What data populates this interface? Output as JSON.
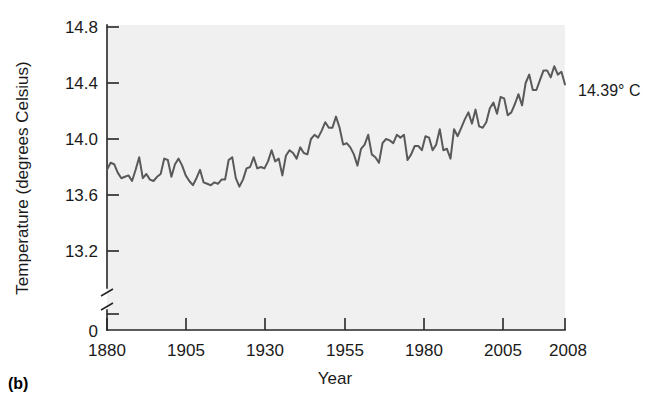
{
  "figure": {
    "panel_label": "(b)",
    "annotation": "14.39° C"
  },
  "chart_data": {
    "type": "line",
    "title": "",
    "xlabel": "Year",
    "ylabel": "Temperature (degrees Celsius)",
    "xlim": [
      1880,
      2008
    ],
    "ylim": [
      13.0,
      14.8
    ],
    "yaxis_break": true,
    "yaxis_break_between": [
      0,
      13.0
    ],
    "grid": false,
    "legend": null,
    "line_color": "#595959",
    "plot_background": "#f0f0f0",
    "xticks": [
      1880,
      1905,
      1930,
      1955,
      1980,
      2005,
      2008
    ],
    "xtick_labels": [
      "1880",
      "1905",
      "1930",
      "1955",
      "1980",
      "2005",
      "2008"
    ],
    "yticks": [
      0,
      13.2,
      13.6,
      14.0,
      14.4,
      14.8
    ],
    "ytick_labels": [
      "0",
      "13.2",
      "13.6",
      "14.0",
      "14.4",
      "14.8"
    ],
    "annotations": [
      {
        "text": "14.39° C",
        "x": 2008,
        "y": 14.39
      }
    ],
    "series": [
      {
        "name": "Global mean surface temperature",
        "x": [
          1880,
          1881,
          1882,
          1883,
          1884,
          1885,
          1886,
          1887,
          1888,
          1889,
          1890,
          1891,
          1892,
          1893,
          1894,
          1895,
          1896,
          1897,
          1898,
          1899,
          1900,
          1901,
          1902,
          1903,
          1904,
          1905,
          1906,
          1907,
          1908,
          1909,
          1910,
          1911,
          1912,
          1913,
          1914,
          1915,
          1916,
          1917,
          1918,
          1919,
          1920,
          1921,
          1922,
          1923,
          1924,
          1925,
          1926,
          1927,
          1928,
          1929,
          1930,
          1931,
          1932,
          1933,
          1934,
          1935,
          1936,
          1937,
          1938,
          1939,
          1940,
          1941,
          1942,
          1943,
          1944,
          1945,
          1946,
          1947,
          1948,
          1949,
          1950,
          1951,
          1952,
          1953,
          1954,
          1955,
          1956,
          1957,
          1958,
          1959,
          1960,
          1961,
          1962,
          1963,
          1964,
          1965,
          1966,
          1967,
          1968,
          1969,
          1970,
          1971,
          1972,
          1973,
          1974,
          1975,
          1976,
          1977,
          1978,
          1979,
          1980,
          1981,
          1982,
          1983,
          1984,
          1985,
          1986,
          1987,
          1988,
          1989,
          1990,
          1991,
          1992,
          1993,
          1994,
          1995,
          1996,
          1997,
          1998,
          1999,
          2000,
          2001,
          2002,
          2003,
          2004,
          2005,
          2006,
          2007,
          2008
        ],
        "values": [
          13.78,
          13.83,
          13.82,
          13.76,
          13.72,
          13.73,
          13.74,
          13.7,
          13.78,
          13.87,
          13.72,
          13.75,
          13.71,
          13.7,
          13.73,
          13.75,
          13.86,
          13.85,
          13.73,
          13.82,
          13.86,
          13.81,
          13.74,
          13.7,
          13.67,
          13.72,
          13.78,
          13.69,
          13.68,
          13.67,
          13.69,
          13.68,
          13.71,
          13.71,
          13.85,
          13.87,
          13.72,
          13.66,
          13.71,
          13.79,
          13.8,
          13.87,
          13.79,
          13.8,
          13.79,
          13.84,
          13.92,
          13.84,
          13.86,
          13.74,
          13.88,
          13.92,
          13.9,
          13.86,
          13.94,
          13.9,
          13.89,
          14.0,
          14.03,
          14.01,
          14.06,
          14.12,
          14.08,
          14.08,
          14.16,
          14.08,
          13.96,
          13.97,
          13.94,
          13.89,
          13.81,
          13.93,
          13.96,
          14.03,
          13.89,
          13.87,
          13.83,
          13.97,
          14.0,
          13.99,
          13.97,
          14.03,
          14.01,
          14.03,
          13.85,
          13.89,
          13.95,
          13.95,
          13.92,
          14.02,
          14.01,
          13.92,
          13.96,
          14.07,
          13.92,
          13.93,
          13.86,
          14.07,
          14.02,
          14.08,
          14.14,
          14.19,
          14.11,
          14.21,
          14.09,
          14.08,
          14.12,
          14.22,
          14.26,
          14.18,
          14.3,
          14.29,
          14.17,
          14.19,
          14.25,
          14.32,
          14.24,
          14.4,
          14.46,
          14.35,
          14.35,
          14.42,
          14.49,
          14.49,
          14.44,
          14.52,
          14.46,
          14.48,
          14.39
        ]
      }
    ]
  }
}
